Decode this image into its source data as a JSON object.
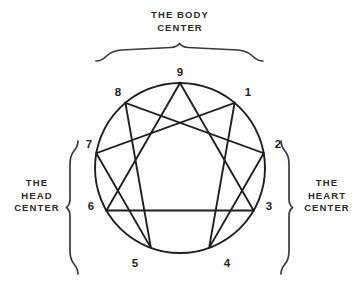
{
  "diagram": {
    "colors": {
      "stroke": "#1f1f1f",
      "text": "#2b2b2b",
      "background": "#ffffff"
    },
    "geometry": {
      "center_x": 180,
      "center_y": 168,
      "radius": 85
    },
    "centers": [
      {
        "id": "body",
        "label": "THE BODY\nCENTER",
        "position": "top",
        "brace": "horizontal-top",
        "points": [
          8,
          9,
          1
        ]
      },
      {
        "id": "head",
        "label": "THE\nHEAD\nCENTER",
        "position": "left",
        "brace": "vertical-left",
        "points": [
          5,
          6,
          7
        ]
      },
      {
        "id": "heart",
        "label": "THE\nHEART\nCENTER",
        "position": "right",
        "brace": "vertical-right",
        "points": [
          2,
          3,
          4
        ]
      }
    ],
    "points": [
      {
        "number": "9",
        "angle_deg": 270,
        "x": 180,
        "y": 83,
        "label_x": 173,
        "label_y": 65
      },
      {
        "number": "1",
        "angle_deg": 310,
        "x": 234.6,
        "y": 102.9,
        "label_x": 241,
        "label_y": 85
      },
      {
        "number": "2",
        "angle_deg": 350,
        "x": 263.7,
        "y": 153.2,
        "label_x": 271,
        "label_y": 137
      },
      {
        "number": "3",
        "angle_deg": 30,
        "x": 253.6,
        "y": 210.5,
        "label_x": 262,
        "label_y": 199
      },
      {
        "number": "4",
        "angle_deg": 70,
        "x": 209.1,
        "y": 247.9,
        "label_x": 220,
        "label_y": 256
      },
      {
        "number": "5",
        "angle_deg": 110,
        "x": 150.9,
        "y": 247.9,
        "label_x": 128,
        "label_y": 256
      },
      {
        "number": "6",
        "angle_deg": 150,
        "x": 106.4,
        "y": 210.5,
        "label_x": 84,
        "label_y": 199
      },
      {
        "number": "7",
        "angle_deg": 190,
        "x": 96.3,
        "y": 153.2,
        "label_x": 82,
        "label_y": 137
      },
      {
        "number": "8",
        "angle_deg": 230,
        "x": 125.4,
        "y": 102.9,
        "label_x": 111,
        "label_y": 85
      }
    ],
    "triangle": {
      "name": "inner-triangle",
      "sequence": [
        "9",
        "3",
        "6"
      ]
    },
    "hexad": {
      "name": "inner-hexad",
      "sequence": [
        "1",
        "4",
        "2",
        "8",
        "5",
        "7"
      ]
    }
  }
}
